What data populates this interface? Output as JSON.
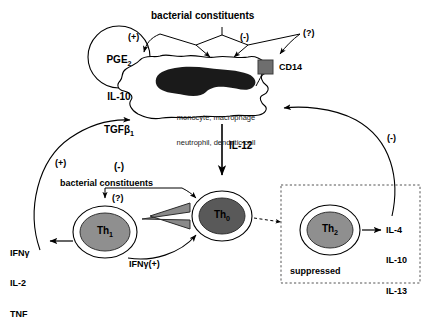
{
  "diagram": {
    "type": "biological-signaling-pathway"
  },
  "top": {
    "bacterial_constituents": "bacterial constituents",
    "sign_positive": "(+)",
    "sign_negative": "(-)",
    "sign_unknown": "(?)"
  },
  "suppressor_circle": {
    "line1": "PGE",
    "line1_sub": "2",
    "line2": "IL-10",
    "line3": "TGFβ",
    "line3_sub": "1",
    "line4": "(-)"
  },
  "receptor": {
    "label": "CD14",
    "color": "#6e6e6e"
  },
  "apc_cell": {
    "line1": "monocyte, macrophage",
    "line2": "neutrophil, dendritic cell",
    "nucleus_color": "#1a1a1a"
  },
  "il12_arrow": {
    "label": "IL-12"
  },
  "th0": {
    "name": "Th",
    "sub": "0",
    "fill": "#595959"
  },
  "th1": {
    "name": "Th",
    "sub": "1",
    "fill": "#8f8f8f",
    "bacterial_constituents": "bacterial constituents",
    "sign_unknown": "(?)",
    "cytokines": [
      "IFNγ",
      "IL-2",
      "TNF"
    ]
  },
  "th2": {
    "name": "Th",
    "sub": "2",
    "fill": "#8f8f8f",
    "cytokines": [
      "IL-4",
      "IL-10",
      "IL-13"
    ],
    "box_label": "suppressed"
  },
  "feedback": {
    "ifng_positive": "IFNγ(+)",
    "left_positive": "(+)",
    "right_negative": "(-)"
  }
}
